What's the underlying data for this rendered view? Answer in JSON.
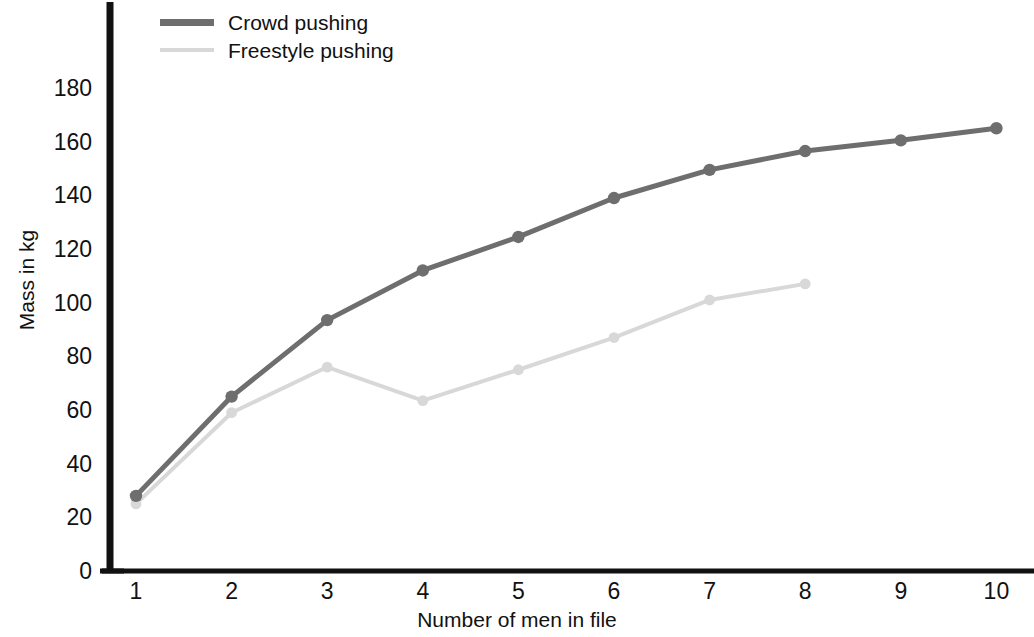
{
  "chart_data": {
    "type": "line",
    "title": "",
    "subtitle": "",
    "xlabel": "Number of men in file",
    "ylabel": "Mass in kg",
    "x": [
      1,
      2,
      3,
      4,
      5,
      6,
      7,
      8,
      9,
      10
    ],
    "xticks": [
      "1",
      "2",
      "3",
      "4",
      "5",
      "6",
      "7",
      "8",
      "9",
      "10"
    ],
    "yticks": [
      "0",
      "20",
      "40",
      "60",
      "80",
      "100",
      "120",
      "140",
      "160",
      "180"
    ],
    "ytick_values": [
      0,
      20,
      40,
      60,
      80,
      100,
      120,
      140,
      160,
      180
    ],
    "xlim": [
      0.6,
      10.45
    ],
    "ylim": [
      0,
      193
    ],
    "grid": false,
    "legend_position": "top-left",
    "series": [
      {
        "name": "Crowd pushing",
        "color": "#6e6e6e",
        "linewidth": 5,
        "marker": "circle",
        "x": [
          1,
          2,
          3,
          4,
          5,
          6,
          7,
          8,
          9,
          10
        ],
        "values": [
          28,
          65,
          93.5,
          112,
          124.5,
          139,
          149.5,
          156.5,
          160.5,
          165
        ]
      },
      {
        "name": "Freestyle pushing",
        "color": "#d8d8d8",
        "linewidth": 4,
        "marker": "circle",
        "x": [
          1,
          2,
          3,
          4,
          5,
          6,
          7,
          8
        ],
        "values": [
          25,
          59,
          76,
          63.5,
          75,
          87,
          101,
          107
        ]
      }
    ],
    "axis_color": "#111111",
    "annotations": []
  },
  "legend": {
    "items": [
      {
        "label": "Crowd pushing",
        "swatch": "crowd"
      },
      {
        "label": "Freestyle pushing",
        "swatch": "freestyle"
      }
    ]
  }
}
